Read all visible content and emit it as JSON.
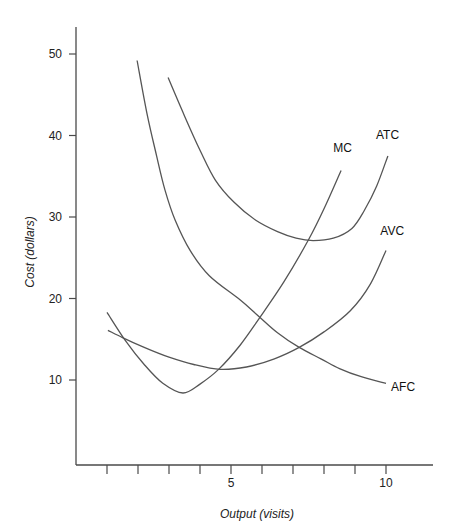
{
  "chart_data": {
    "type": "line",
    "title": "",
    "xlabel": "Output (visits)",
    "ylabel": "Cost (dollars)",
    "xlim": [
      0,
      11.5
    ],
    "ylim": [
      0,
      53
    ],
    "x_ticks": [
      1,
      2,
      3,
      4,
      5,
      6,
      7,
      8,
      9,
      10
    ],
    "x_tick_labels": {
      "5": "5",
      "10": "10"
    },
    "y_ticks": [
      10,
      20,
      30,
      40,
      50
    ],
    "y_tick_labels": [
      "10",
      "20",
      "30",
      "40",
      "50"
    ],
    "grid": false,
    "legend": "inline labels at curve ends",
    "series": [
      {
        "name": "MC",
        "x": [
          1.0,
          1.6,
          2.2,
          2.8,
          3.45,
          4.0,
          4.6,
          5.3,
          5.9,
          6.7,
          7.5,
          8.0,
          8.55
        ],
        "y": [
          18.3,
          14.8,
          11.9,
          9.6,
          8.4,
          9.5,
          11.3,
          14.3,
          17.5,
          22.0,
          27.2,
          31.0,
          35.7
        ]
      },
      {
        "name": "AVC",
        "x": [
          1.03,
          1.5,
          2.2,
          3.0,
          3.8,
          4.65,
          5.5,
          6.4,
          7.2,
          8.0,
          8.85,
          9.5,
          10.0
        ],
        "y": [
          16.1,
          15.2,
          14.0,
          12.8,
          11.9,
          11.3,
          11.6,
          12.6,
          14.0,
          15.9,
          18.5,
          21.8,
          25.9
        ]
      },
      {
        "name": "ATC",
        "x": [
          2.97,
          3.5,
          4.0,
          4.5,
          5.1,
          5.8,
          6.5,
          7.1,
          7.65,
          8.3,
          8.9,
          9.3,
          9.7,
          10.06
        ],
        "y": [
          47.1,
          42.4,
          38.2,
          34.5,
          31.8,
          29.6,
          28.2,
          27.4,
          27.1,
          27.4,
          28.6,
          30.8,
          33.8,
          37.5
        ]
      },
      {
        "name": "AFC",
        "x": [
          1.97,
          2.3,
          2.6,
          2.87,
          3.2,
          3.68,
          4.3,
          5.3,
          5.9,
          6.5,
          7.2,
          7.9,
          8.5,
          9.2,
          10.0
        ],
        "y": [
          49.2,
          42.5,
          37.5,
          33.3,
          29.6,
          25.9,
          22.8,
          19.8,
          17.8,
          15.8,
          14.0,
          12.6,
          11.4,
          10.4,
          9.6
        ]
      }
    ],
    "curve_labels": [
      {
        "name": "MC",
        "x": 8.6,
        "y": 38.0
      },
      {
        "name": "ATC",
        "x": 10.05,
        "y": 39.6
      },
      {
        "name": "AVC",
        "x": 10.2,
        "y": 27.8
      },
      {
        "name": "AFC",
        "x": 10.55,
        "y": 8.7
      }
    ]
  }
}
